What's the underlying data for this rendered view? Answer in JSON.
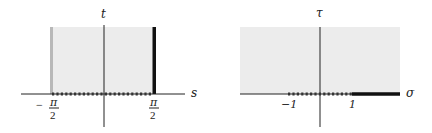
{
  "left_panel": {
    "vertical_axis_label": "t",
    "horizontal_axis_label": "s",
    "tick_left_numerator": "π",
    "tick_left_denominator": "2",
    "tick_left_sign": "−",
    "tick_right_numerator": "π",
    "tick_right_denominator": "2",
    "region": "strip −π/2 < s < π/2, t > 0",
    "shade_color": "#ececec",
    "left_edge_color": "#b8b8b8",
    "right_edge_color": "#111111"
  },
  "right_panel": {
    "vertical_axis_label": "τ",
    "horizontal_axis_label": "σ",
    "tick_left": "−1",
    "tick_right": "1",
    "region": "upper half-plane τ > 0",
    "shade_color": "#ececec",
    "thick_segment": "σ > 1",
    "dotted_segment": "−1 < σ < 1"
  }
}
